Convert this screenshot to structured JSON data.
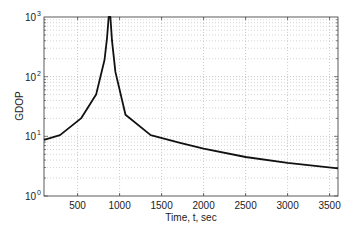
{
  "chart_data": {
    "type": "line",
    "title": "",
    "xlabel": "Time, t, sec",
    "ylabel": "GDOP",
    "xscale": "linear",
    "yscale": "log",
    "xlim": [
      100,
      3600
    ],
    "ylim": [
      1,
      1000
    ],
    "grid": true,
    "legend": null,
    "x_ticks": [
      500,
      1000,
      1500,
      2000,
      2500,
      3000,
      3500
    ],
    "x_tick_labels": [
      "500",
      "1000",
      "1500",
      "2000",
      "2500",
      "3000",
      "3500"
    ],
    "y_ticks": [
      1,
      10,
      100,
      1000
    ],
    "y_tick_labels": [
      {
        "base": "10",
        "exp": "0"
      },
      {
        "base": "10",
        "exp": "1"
      },
      {
        "base": "10",
        "exp": "2"
      },
      {
        "base": "10",
        "exp": "3"
      }
    ],
    "series": [
      {
        "name": "GDOP",
        "color": "#111111",
        "x": [
          100,
          290,
          540,
          720,
          820,
          850,
          870,
          880,
          890,
          910,
          950,
          1070,
          1370,
          1720,
          2000,
          2500,
          3000,
          3600
        ],
        "y": [
          8.7,
          10.5,
          20,
          50,
          190,
          440,
          1000,
          1000,
          1000,
          400,
          120,
          23,
          10.5,
          7.8,
          6.2,
          4.5,
          3.6,
          2.9
        ]
      }
    ]
  }
}
